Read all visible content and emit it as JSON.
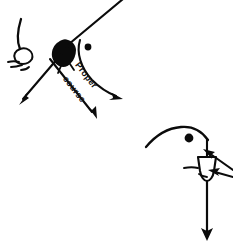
{
  "figure": {
    "background_color": "#ffffff",
    "ink_color": "#0b0b0b",
    "width": 233,
    "height": 250
  },
  "labels": {
    "proper": "Proper",
    "course": "course"
  },
  "boats": {
    "windward": {
      "name": "windward-boat",
      "hull_style": "filled",
      "position": {
        "x": 60,
        "y": 53
      }
    },
    "leeward": {
      "name": "leeward-boat",
      "hull_style": "outline",
      "position": {
        "x": 205,
        "y": 168
      }
    }
  },
  "marks": {
    "upper_mark": {
      "name": "upper-mark-dot",
      "x": 88,
      "y": 47,
      "radius": 3.2
    },
    "lower_mark": {
      "name": "lower-mark-dot",
      "x": 190,
      "y": 138,
      "radius": 4.2
    }
  },
  "arrows": {
    "proper_course": {
      "name": "proper-course-arrow",
      "label": "Proper course",
      "from": {
        "x": 52,
        "y": 62
      },
      "to": {
        "x": 96,
        "y": 117
      }
    },
    "sail_line": {
      "name": "sail-line-arrow",
      "from": {
        "x": 70,
        "y": 46
      },
      "to": {
        "x": 20,
        "y": 104
      }
    },
    "curved_course": {
      "name": "curved-course-arrow",
      "from": {
        "x": 81,
        "y": 41
      },
      "to": {
        "x": 122,
        "y": 99
      }
    },
    "leeward_heading": {
      "name": "leeward-heading-arrow",
      "from": {
        "x": 208,
        "y": 184
      },
      "to": {
        "x": 209,
        "y": 239
      }
    },
    "incoming_upper": {
      "name": "incoming-arrow-upper",
      "from": {
        "x": 233,
        "y": 171
      },
      "to": {
        "x": 205,
        "y": 152
      }
    },
    "incoming_lower": {
      "name": "incoming-arrow-lower",
      "from": {
        "x": 233,
        "y": 176
      },
      "to": {
        "x": 209,
        "y": 172
      }
    }
  },
  "curves": {
    "windward_sail": {
      "name": "windward-sail-curve"
    },
    "leeward_sail": {
      "name": "leeward-sail-curve"
    },
    "upper_mark_curve": {
      "name": "upper-mark-curve"
    },
    "approach_line": {
      "name": "approach-line"
    }
  }
}
